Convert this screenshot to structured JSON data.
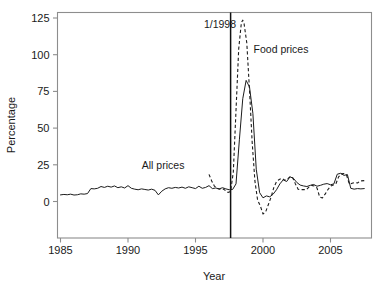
{
  "chart_data": {
    "type": "line",
    "title": "",
    "xlabel": "Year",
    "ylabel": "Percentage",
    "xlim": [
      1985,
      2007.6
    ],
    "ylim": [
      -13,
      130
    ],
    "grid": false,
    "legend_position": "inline-annotations",
    "xticks": [
      1985,
      1990,
      1995,
      2000,
      2005
    ],
    "xtick_labels": [
      "1985",
      "1990",
      "1995",
      "2000",
      "2005"
    ],
    "yticks": [
      0,
      25,
      50,
      75,
      100,
      125
    ],
    "ytick_labels": [
      "0",
      "25",
      "50",
      "75",
      "100",
      "125"
    ],
    "annotations": [
      {
        "name": "event-line-label",
        "text": "1/1998",
        "x": 1998.0,
        "y": 118,
        "anchor": "end"
      },
      {
        "name": "food-prices-label",
        "text": "Food prices",
        "x": 1999.3,
        "y": 101,
        "anchor": "start"
      },
      {
        "name": "all-prices-label",
        "text": "All prices",
        "x": 1992.6,
        "y": 22,
        "anchor": "middle"
      }
    ],
    "reference_lines": [
      {
        "name": "jan-1998-vertical",
        "orientation": "vertical",
        "x": 1997.6,
        "style": "solid"
      }
    ],
    "series": [
      {
        "name": "All prices",
        "style": "solid",
        "x": [
          1985.0,
          1985.25,
          1985.5,
          1985.75,
          1986.0,
          1986.25,
          1986.5,
          1986.75,
          1987.0,
          1987.25,
          1987.5,
          1987.75,
          1988.0,
          1988.25,
          1988.5,
          1988.75,
          1989.0,
          1989.25,
          1989.5,
          1989.75,
          1990.0,
          1990.25,
          1990.5,
          1990.75,
          1991.0,
          1991.25,
          1991.5,
          1991.75,
          1992.0,
          1992.25,
          1992.5,
          1992.75,
          1993.0,
          1993.25,
          1993.5,
          1993.75,
          1994.0,
          1994.25,
          1994.5,
          1994.75,
          1995.0,
          1995.25,
          1995.5,
          1995.75,
          1996.0,
          1996.25,
          1996.5,
          1996.75,
          1997.0,
          1997.25,
          1997.5,
          1997.75,
          1998.0,
          1998.25,
          1998.5,
          1998.75,
          1999.0,
          1999.25,
          1999.5,
          1999.75,
          2000.0,
          2000.25,
          2000.5,
          2000.75,
          2001.0,
          2001.25,
          2001.5,
          2001.75,
          2002.0,
          2002.25,
          2002.5,
          2002.75,
          2003.0,
          2003.25,
          2003.5,
          2003.75,
          2004.0,
          2004.25,
          2004.5,
          2004.75,
          2005.0,
          2005.25,
          2005.5,
          2005.75,
          2006.0,
          2006.25,
          2006.5,
          2006.75,
          2007.0,
          2007.25,
          2007.5
        ],
        "y": [
          4.5,
          4.8,
          4.6,
          5.0,
          4.4,
          4.6,
          5.2,
          5.0,
          5.4,
          8.8,
          8.6,
          9.0,
          10.2,
          9.6,
          10.4,
          9.8,
          10.6,
          9.4,
          10.0,
          9.2,
          10.8,
          9.0,
          8.4,
          8.0,
          8.6,
          8.2,
          7.8,
          8.4,
          7.6,
          4.5,
          7.0,
          8.6,
          9.4,
          9.0,
          9.6,
          9.2,
          9.8,
          9.0,
          10.0,
          9.4,
          8.8,
          10.4,
          9.0,
          9.6,
          10.8,
          8.8,
          9.2,
          8.6,
          9.4,
          8.6,
          8.0,
          8.2,
          12.0,
          42.0,
          70.0,
          82.5,
          78.0,
          60.0,
          22.0,
          6.0,
          2.5,
          3.8,
          3.2,
          5.0,
          8.0,
          12.0,
          14.8,
          13.6,
          16.8,
          15.8,
          13.0,
          11.2,
          10.6,
          10.2,
          11.0,
          11.6,
          10.4,
          11.0,
          11.8,
          12.2,
          11.4,
          12.0,
          18.6,
          19.2,
          17.8,
          18.4,
          9.0,
          8.4,
          8.8,
          8.6,
          8.8
        ],
        "peak": 82.5,
        "min": 2.5
      },
      {
        "name": "Food prices",
        "style": "dashed",
        "x": [
          1996.0,
          1996.2,
          1996.4,
          1996.6,
          1996.8,
          1997.0,
          1997.2,
          1997.4,
          1997.6,
          1997.8,
          1998.0,
          1998.2,
          1998.4,
          1998.5,
          1998.6,
          1998.8,
          1999.0,
          1999.2,
          1999.4,
          1999.6,
          1999.8,
          2000.0,
          2000.2,
          2000.4,
          2000.6,
          2000.8,
          2001.0,
          2001.2,
          2001.4,
          2001.6,
          2001.8,
          2002.0,
          2002.2,
          2002.4,
          2002.6,
          2002.8,
          2003.0,
          2003.2,
          2003.4,
          2003.6,
          2003.8,
          2004.0,
          2004.2,
          2004.4,
          2004.6,
          2004.8,
          2005.0,
          2005.2,
          2005.4,
          2005.6,
          2005.8,
          2006.0,
          2006.2,
          2006.4,
          2006.6,
          2006.8,
          2007.0,
          2007.2,
          2007.5
        ],
        "y": [
          18.5,
          14.0,
          10.5,
          9.0,
          8.4,
          8.8,
          7.6,
          6.2,
          6.8,
          20.0,
          62.0,
          104.0,
          122.0,
          123.5,
          121.0,
          108.0,
          76.0,
          40.0,
          14.0,
          1.0,
          -3.0,
          -8.5,
          -7.0,
          -2.0,
          3.0,
          9.5,
          13.5,
          15.0,
          15.8,
          14.5,
          15.2,
          17.0,
          16.2,
          12.0,
          8.4,
          8.0,
          8.2,
          8.0,
          9.8,
          11.0,
          10.6,
          9.2,
          3.0,
          2.4,
          5.0,
          8.0,
          10.4,
          11.2,
          12.0,
          16.8,
          18.8,
          19.0,
          17.6,
          11.8,
          12.4,
          13.0,
          12.6,
          14.0,
          14.2
        ],
        "peak": 123.5,
        "min": -8.5
      }
    ]
  },
  "colors": {
    "line": "#1c1c1c",
    "frame": "#8d8d8d",
    "background": "#ffffff",
    "text": "#1a1a1a"
  }
}
